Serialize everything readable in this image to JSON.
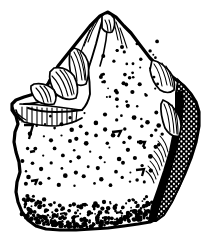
{
  "figure": {
    "kind": "archaeological-line-drawing",
    "view": "dorsal-face",
    "technique": "ink-line-art-stipple-hatching",
    "background_color": "#ffffff",
    "ink_color": "#000000",
    "caption": "",
    "label": "",
    "scale_bar": "",
    "width_px": 218,
    "height_px": 249
  },
  "outline": {
    "name": "artifact-silhouette",
    "description": "irregular shield shape, pointed apex top-centre",
    "stroke_color": "#000000",
    "fill_color": "#ffffff",
    "path": "M100,16 L108,12 L116,17 L124,26 L131,33 L140,45 L150,58 L158,66 L166,72 L174,78 L184,86 L191,94 L196,102 L199,112 L199,126 L196,142 L191,158 L185,173 L178,188 L172,200 L166,210 L158,218 L150,222 L138,224 L124,226 L108,228 L92,229 L76,230 L60,230 L46,229 L36,226 L28,220 L22,212 L18,202 L16,192 L17,182 L20,172 L19,162 L16,152 L14,142 L15,132 L18,124 L16,116 L12,110 L12,104 L16,100 L24,97 L34,94 L42,90 L48,84 L52,76 L58,66 L66,56 L74,46 L82,36 L90,26 Z"
  },
  "edges": [
    {
      "name": "upper-left-retouched-edge",
      "description": "steeply retouched lateral edge with hatched flake scars",
      "treatment": "scalar-retouch"
    },
    {
      "name": "right-lateral-cortex-band",
      "description": "dark reticulated band representing cortex / cross-section",
      "treatment": "reticulated-shading"
    },
    {
      "name": "basal-stippled-edge",
      "description": "heavy stipple concentration along the lower margin",
      "treatment": "dense-stipple"
    },
    {
      "name": "apex-ridge",
      "description": "pointed dorsal ridge at the top of the piece",
      "treatment": "ridge-line"
    }
  ],
  "surface": {
    "name": "dorsal-surface",
    "texture": "scattered-stipple-dots-and-tick-marks",
    "dot_color": "#000000"
  },
  "scars": {
    "name": "flake-scar-group",
    "count_upper_left": 5,
    "count_right": 3,
    "count_apex": 4,
    "hatch_color": "#000000"
  }
}
